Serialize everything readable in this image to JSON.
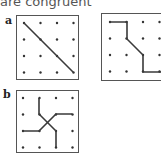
{
  "caption": "are congruent",
  "figures": {
    "a": {
      "label": "a",
      "panels": [
        {
          "name": "grid-a-left",
          "box": {
            "x": 16,
            "y": 15,
            "w": 62,
            "h": 64
          },
          "dots": {
            "x0": 24,
            "y0": 23,
            "dx": 16.5,
            "dy": 16.5,
            "cols": 4,
            "rows": 4
          },
          "paths": [
            [
              [
                24,
                23
              ],
              [
                73,
                72
              ]
            ]
          ]
        },
        {
          "name": "grid-a-right",
          "box": {
            "x": 101,
            "y": 13,
            "w": 66,
            "h": 67
          },
          "dots": {
            "x0": 110,
            "y0": 22,
            "dx": 16.5,
            "dy": 16.5,
            "cols": 4,
            "rows": 4
          },
          "paths": [
            [
              [
                110,
                22
              ],
              [
                127,
                22
              ],
              [
                127,
                39
              ],
              [
                143,
                55
              ],
              [
                143,
                72
              ],
              [
                161,
                72
              ]
            ]
          ]
        }
      ]
    },
    "b": {
      "label": "b",
      "panels": [
        {
          "name": "grid-b",
          "box": {
            "x": 16,
            "y": 90,
            "w": 62,
            "h": 62
          },
          "dots": {
            "x0": 23,
            "y0": 98,
            "dx": 16.5,
            "dy": 16.5,
            "cols": 4,
            "rows": 4
          },
          "paths": [
            [
              [
                39,
                98
              ],
              [
                39,
                114
              ],
              [
                56,
                131
              ],
              [
                56,
                147
              ]
            ],
            [
              [
                23,
                131
              ],
              [
                39,
                131
              ],
              [
                56,
                114
              ],
              [
                72,
                114
              ]
            ]
          ]
        }
      ]
    }
  },
  "colors": {
    "line": "#3a3a3a",
    "dot": "#333333",
    "box": "#555555"
  }
}
